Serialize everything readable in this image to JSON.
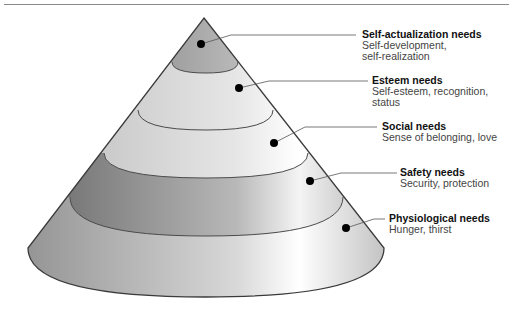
{
  "diagram": {
    "type": "hierarchy-cone",
    "levels": [
      {
        "title": "Self-actualization needs",
        "desc_lines": [
          "Self-development,",
          "self-realization"
        ]
      },
      {
        "title": "Esteem needs",
        "desc_lines": [
          "Self-esteem, recognition,",
          "status"
        ]
      },
      {
        "title": "Social needs",
        "desc_lines": [
          "Sense of belonging, love"
        ]
      },
      {
        "title": "Safety needs",
        "desc_lines": [
          "Security, protection"
        ]
      },
      {
        "title": "Physiological needs",
        "desc_lines": [
          "Hunger, thirst"
        ]
      }
    ],
    "colors": {
      "outline": "#3a3a3a",
      "leader": "#555555",
      "dot": "#000000",
      "rule": "#8a8a8a"
    }
  }
}
